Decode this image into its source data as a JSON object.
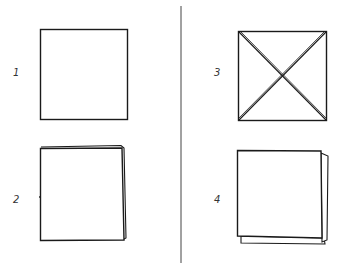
{
  "diagram": {
    "divider_color": "#444444",
    "stroke_color": "#1a1a1a",
    "steps": [
      {
        "label": "1",
        "shape": "plain square"
      },
      {
        "label": "2",
        "shape": "square folded in half (back layer visible top-right)"
      },
      {
        "label": "3",
        "shape": "square with both diagonal creases (X)"
      },
      {
        "label": "4",
        "shape": "square folded, back layers visible right and bottom"
      }
    ]
  }
}
